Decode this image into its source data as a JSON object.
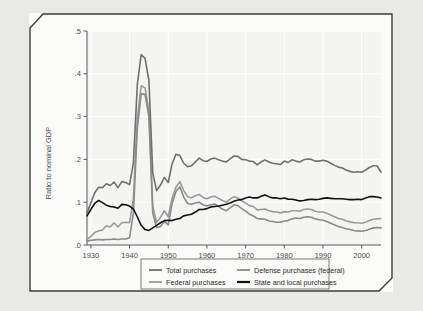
{
  "chart_data": {
    "type": "line",
    "title": "",
    "xlabel": "",
    "ylabel": "Ratio to nominal GDP",
    "xlim": [
      1929,
      2005
    ],
    "ylim": [
      0,
      0.5
    ],
    "grid": true,
    "legend_position": "bottom",
    "xticks": [
      "1930",
      "1940",
      "1950",
      "1960",
      "1970",
      "1980",
      "1990",
      "2000"
    ],
    "xtick_values": [
      1930,
      1940,
      1950,
      1960,
      1970,
      1980,
      1990,
      2000
    ],
    "yticks": [
      ".0",
      ".1",
      ".2",
      ".3",
      ".4",
      ".5"
    ],
    "ytick_values": [
      0.0,
      0.1,
      0.2,
      0.3,
      0.4,
      0.5
    ],
    "x": [
      1929,
      1930,
      1931,
      1932,
      1933,
      1934,
      1935,
      1936,
      1937,
      1938,
      1939,
      1940,
      1941,
      1942,
      1943,
      1944,
      1945,
      1946,
      1947,
      1948,
      1949,
      1950,
      1951,
      1952,
      1953,
      1954,
      1955,
      1956,
      1957,
      1958,
      1959,
      1960,
      1961,
      1962,
      1963,
      1964,
      1965,
      1966,
      1967,
      1968,
      1969,
      1970,
      1971,
      1972,
      1973,
      1974,
      1975,
      1976,
      1977,
      1978,
      1979,
      1980,
      1981,
      1982,
      1983,
      1984,
      1985,
      1986,
      1987,
      1988,
      1989,
      1990,
      1991,
      1992,
      1993,
      1994,
      1995,
      1996,
      1997,
      1998,
      1999,
      2000,
      2001,
      2002,
      2003,
      2004,
      2005
    ],
    "series": [
      {
        "name": "Total purchases",
        "color": "#6f6f6f",
        "values": [
          0.075,
          0.098,
          0.122,
          0.135,
          0.134,
          0.143,
          0.139,
          0.147,
          0.134,
          0.148,
          0.146,
          0.141,
          0.192,
          0.374,
          0.445,
          0.436,
          0.385,
          0.168,
          0.127,
          0.14,
          0.158,
          0.146,
          0.19,
          0.212,
          0.209,
          0.191,
          0.183,
          0.185,
          0.194,
          0.203,
          0.197,
          0.195,
          0.201,
          0.203,
          0.199,
          0.196,
          0.194,
          0.201,
          0.208,
          0.207,
          0.2,
          0.199,
          0.196,
          0.195,
          0.187,
          0.194,
          0.199,
          0.194,
          0.191,
          0.19,
          0.188,
          0.196,
          0.193,
          0.199,
          0.196,
          0.194,
          0.199,
          0.201,
          0.2,
          0.196,
          0.196,
          0.198,
          0.196,
          0.191,
          0.186,
          0.182,
          0.18,
          0.175,
          0.172,
          0.17,
          0.171,
          0.17,
          0.175,
          0.181,
          0.185,
          0.185,
          0.17
        ]
      },
      {
        "name": "Federal purchases",
        "color": "#9a9a9a",
        "values": [
          0.013,
          0.02,
          0.029,
          0.033,
          0.035,
          0.045,
          0.042,
          0.052,
          0.042,
          0.052,
          0.053,
          0.052,
          0.108,
          0.296,
          0.372,
          0.367,
          0.315,
          0.09,
          0.053,
          0.064,
          0.08,
          0.066,
          0.11,
          0.135,
          0.148,
          0.127,
          0.113,
          0.11,
          0.115,
          0.118,
          0.111,
          0.108,
          0.112,
          0.114,
          0.109,
          0.104,
          0.1,
          0.107,
          0.113,
          0.11,
          0.103,
          0.098,
          0.092,
          0.09,
          0.082,
          0.083,
          0.084,
          0.08,
          0.078,
          0.077,
          0.075,
          0.078,
          0.077,
          0.08,
          0.08,
          0.079,
          0.083,
          0.084,
          0.083,
          0.079,
          0.077,
          0.077,
          0.074,
          0.07,
          0.066,
          0.062,
          0.06,
          0.056,
          0.054,
          0.052,
          0.052,
          0.051,
          0.053,
          0.057,
          0.06,
          0.061,
          0.062
        ]
      },
      {
        "name": "Defense purchases (federal)",
        "color": "#8a8a8a",
        "values": [
          0.009,
          0.011,
          0.012,
          0.013,
          0.012,
          0.013,
          0.013,
          0.014,
          0.013,
          0.014,
          0.014,
          0.017,
          0.075,
          0.272,
          0.353,
          0.352,
          0.3,
          0.074,
          0.041,
          0.043,
          0.055,
          0.047,
          0.097,
          0.125,
          0.136,
          0.112,
          0.097,
          0.095,
          0.098,
          0.1,
          0.094,
          0.091,
          0.094,
          0.096,
          0.09,
          0.084,
          0.08,
          0.087,
          0.094,
          0.092,
          0.085,
          0.079,
          0.072,
          0.068,
          0.062,
          0.061,
          0.06,
          0.056,
          0.055,
          0.053,
          0.053,
          0.056,
          0.057,
          0.061,
          0.063,
          0.062,
          0.065,
          0.066,
          0.065,
          0.061,
          0.059,
          0.058,
          0.055,
          0.051,
          0.047,
          0.043,
          0.041,
          0.038,
          0.036,
          0.034,
          0.033,
          0.032,
          0.034,
          0.037,
          0.04,
          0.041,
          0.04
        ]
      },
      {
        "name": "State and local purchases",
        "color": "#111111",
        "values": [
          0.068,
          0.083,
          0.097,
          0.104,
          0.099,
          0.093,
          0.09,
          0.089,
          0.086,
          0.095,
          0.094,
          0.091,
          0.084,
          0.066,
          0.046,
          0.036,
          0.034,
          0.04,
          0.046,
          0.052,
          0.057,
          0.058,
          0.057,
          0.06,
          0.062,
          0.068,
          0.07,
          0.072,
          0.077,
          0.083,
          0.083,
          0.085,
          0.089,
          0.09,
          0.091,
          0.093,
          0.095,
          0.098,
          0.102,
          0.105,
          0.106,
          0.11,
          0.112,
          0.11,
          0.11,
          0.114,
          0.117,
          0.113,
          0.11,
          0.11,
          0.108,
          0.11,
          0.107,
          0.107,
          0.105,
          0.103,
          0.104,
          0.106,
          0.107,
          0.106,
          0.107,
          0.109,
          0.11,
          0.109,
          0.108,
          0.108,
          0.108,
          0.107,
          0.106,
          0.106,
          0.107,
          0.106,
          0.11,
          0.113,
          0.113,
          0.112,
          0.11
        ]
      }
    ]
  },
  "legend": {
    "items": [
      {
        "label": "Total purchases",
        "color": "#6f6f6f"
      },
      {
        "label": "Defense purchases (federal)",
        "color": "#8a8a8a"
      },
      {
        "label": "Federal purchases",
        "color": "#9a9a9a"
      },
      {
        "label": "State and local purchases",
        "color": "#111111"
      }
    ]
  }
}
